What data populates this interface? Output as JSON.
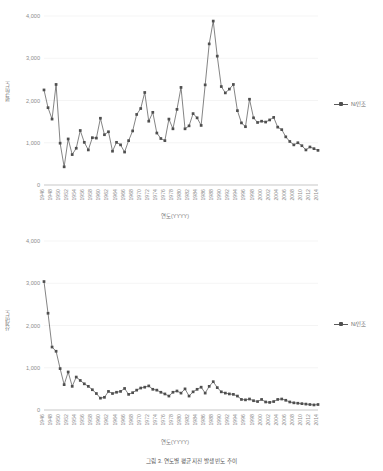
{
  "figure": {
    "caption": "그림 3. 연도별 평균 지진 발생 빈도 추이"
  },
  "charts": [
    {
      "id": "chart-top",
      "axis_title_y": "평균빈도",
      "axis_title_x": "연도(YYYY)",
      "legend_label": "N/인조",
      "legend_marker_name": "legend-line-marker"
    },
    {
      "id": "chart-bottom",
      "axis_title_y": "산계빈도",
      "axis_title_x": "연도(YYYY)",
      "legend_label": "N/인조",
      "legend_marker_name": "legend-line-marker"
    }
  ],
  "chart_data": [
    {
      "type": "line",
      "title": "",
      "xlabel": "연도(YYYY)",
      "ylabel": "평균빈도",
      "ylim": [
        0,
        4000
      ],
      "yticks": [
        "0",
        "1,000",
        "2,000",
        "3,000",
        "4,000"
      ],
      "ytick_values": [
        0,
        1000,
        2000,
        3000,
        4000
      ],
      "grid": true,
      "legend_position": "right",
      "marker": "square",
      "color": "#4f4f4f",
      "x": [
        1946,
        1947,
        1948,
        1949,
        1950,
        1951,
        1952,
        1953,
        1954,
        1955,
        1956,
        1957,
        1958,
        1959,
        1960,
        1961,
        1962,
        1963,
        1964,
        1965,
        1966,
        1967,
        1968,
        1969,
        1970,
        1971,
        1972,
        1973,
        1974,
        1975,
        1976,
        1977,
        1978,
        1979,
        1980,
        1981,
        1982,
        1983,
        1984,
        1985,
        1986,
        1987,
        1988,
        1989,
        1990,
        1991,
        1992,
        1993,
        1994,
        1995,
        1996,
        1997,
        1998,
        1999,
        2000,
        2001,
        2002,
        2003,
        2004,
        2005,
        2006,
        2007,
        2008,
        2009,
        2010,
        2011,
        2012,
        2013,
        2014
      ],
      "xtick_labels": [
        "1946",
        "1947",
        "1948",
        "1949",
        "1950",
        "1951",
        "1952",
        "1953",
        "1954",
        "1955",
        "1956",
        "1957",
        "1958",
        "1959",
        "1960",
        "1961",
        "1962",
        "1963",
        "1964",
        "1965",
        "1966",
        "1967",
        "1968",
        "1969",
        "1970",
        "1971",
        "1972",
        "1973",
        "1974",
        "1975",
        "1976",
        "1977",
        "1978",
        "1979",
        "1980",
        "1981",
        "1982",
        "1983",
        "1984",
        "1985",
        "1986",
        "1987",
        "1988",
        "1989",
        "1990",
        "1991",
        "1992",
        "1993",
        "1994",
        "1995",
        "1996",
        "1997",
        "1998",
        "1999",
        "2000",
        "2001",
        "2002",
        "2003",
        "2004",
        "2005",
        "2006",
        "2007",
        "2008",
        "2009",
        "2010",
        "2011",
        "2012",
        "2013",
        "2014"
      ],
      "series": [
        {
          "name": "N/인조",
          "values": [
            2250,
            1830,
            1560,
            2380,
            990,
            430,
            1090,
            720,
            870,
            1290,
            1010,
            830,
            1120,
            1110,
            1580,
            1190,
            1260,
            800,
            1010,
            950,
            780,
            1050,
            1280,
            1670,
            1810,
            2190,
            1510,
            1720,
            1230,
            1100,
            1050,
            1560,
            1330,
            1790,
            2310,
            1330,
            1400,
            1690,
            1590,
            1410,
            2370,
            3340,
            3880,
            3050,
            2330,
            2180,
            2270,
            2380,
            1760,
            1470,
            1380,
            2030,
            1590,
            1480,
            1510,
            1490,
            1540,
            1600,
            1370,
            1310,
            1140,
            1030,
            950,
            1000,
            930,
            830,
            900,
            860,
            820
          ]
        }
      ]
    },
    {
      "type": "line",
      "title": "",
      "xlabel": "연도(YYYY)",
      "ylabel": "산계빈도",
      "ylim": [
        0,
        4000
      ],
      "yticks": [
        "0",
        "1,000",
        "2,000",
        "3,000",
        "4,000"
      ],
      "ytick_values": [
        0,
        1000,
        2000,
        3000,
        4000
      ],
      "grid": true,
      "legend_position": "right",
      "marker": "square",
      "color": "#4f4f4f",
      "x": [
        1946,
        1947,
        1948,
        1949,
        1950,
        1951,
        1952,
        1953,
        1954,
        1955,
        1956,
        1957,
        1958,
        1959,
        1960,
        1961,
        1962,
        1963,
        1964,
        1965,
        1966,
        1967,
        1968,
        1969,
        1970,
        1971,
        1972,
        1973,
        1974,
        1975,
        1976,
        1977,
        1978,
        1979,
        1980,
        1981,
        1982,
        1983,
        1984,
        1985,
        1986,
        1987,
        1988,
        1989,
        1990,
        1991,
        1992,
        1993,
        1994,
        1995,
        1996,
        1997,
        1998,
        1999,
        2000,
        2001,
        2002,
        2003,
        2004,
        2005,
        2006,
        2007,
        2008,
        2009,
        2010,
        2011,
        2012,
        2013,
        2014
      ],
      "xtick_labels": [
        "1946",
        "1947",
        "1948",
        "1949",
        "1950",
        "1951",
        "1952",
        "1953",
        "1954",
        "1955",
        "1956",
        "1957",
        "1958",
        "1959",
        "1960",
        "1961",
        "1962",
        "1963",
        "1964",
        "1965",
        "1966",
        "1967",
        "1968",
        "1969",
        "1970",
        "1971",
        "1972",
        "1973",
        "1974",
        "1975",
        "1976",
        "1977",
        "1978",
        "1979",
        "1980",
        "1981",
        "1982",
        "1983",
        "1984",
        "1985",
        "1986",
        "1987",
        "1988",
        "1989",
        "1990",
        "1991",
        "1992",
        "1993",
        "1994",
        "1995",
        "1996",
        "1997",
        "1998",
        "1999",
        "2000",
        "2001",
        "2002",
        "2003",
        "2004",
        "2005",
        "2006",
        "2007",
        "2008",
        "2009",
        "2010",
        "2011",
        "2012",
        "2013",
        "2014"
      ],
      "series": [
        {
          "name": "N/인조",
          "values": [
            3040,
            2290,
            1490,
            1390,
            980,
            600,
            900,
            560,
            780,
            700,
            620,
            560,
            480,
            390,
            280,
            300,
            440,
            390,
            420,
            440,
            510,
            370,
            410,
            470,
            520,
            540,
            570,
            490,
            470,
            420,
            380,
            330,
            420,
            450,
            400,
            500,
            330,
            430,
            490,
            540,
            400,
            560,
            670,
            530,
            430,
            400,
            380,
            370,
            330,
            250,
            240,
            260,
            220,
            200,
            250,
            190,
            180,
            200,
            250,
            260,
            230,
            190,
            170,
            160,
            150,
            140,
            130,
            120,
            130
          ]
        }
      ]
    }
  ]
}
